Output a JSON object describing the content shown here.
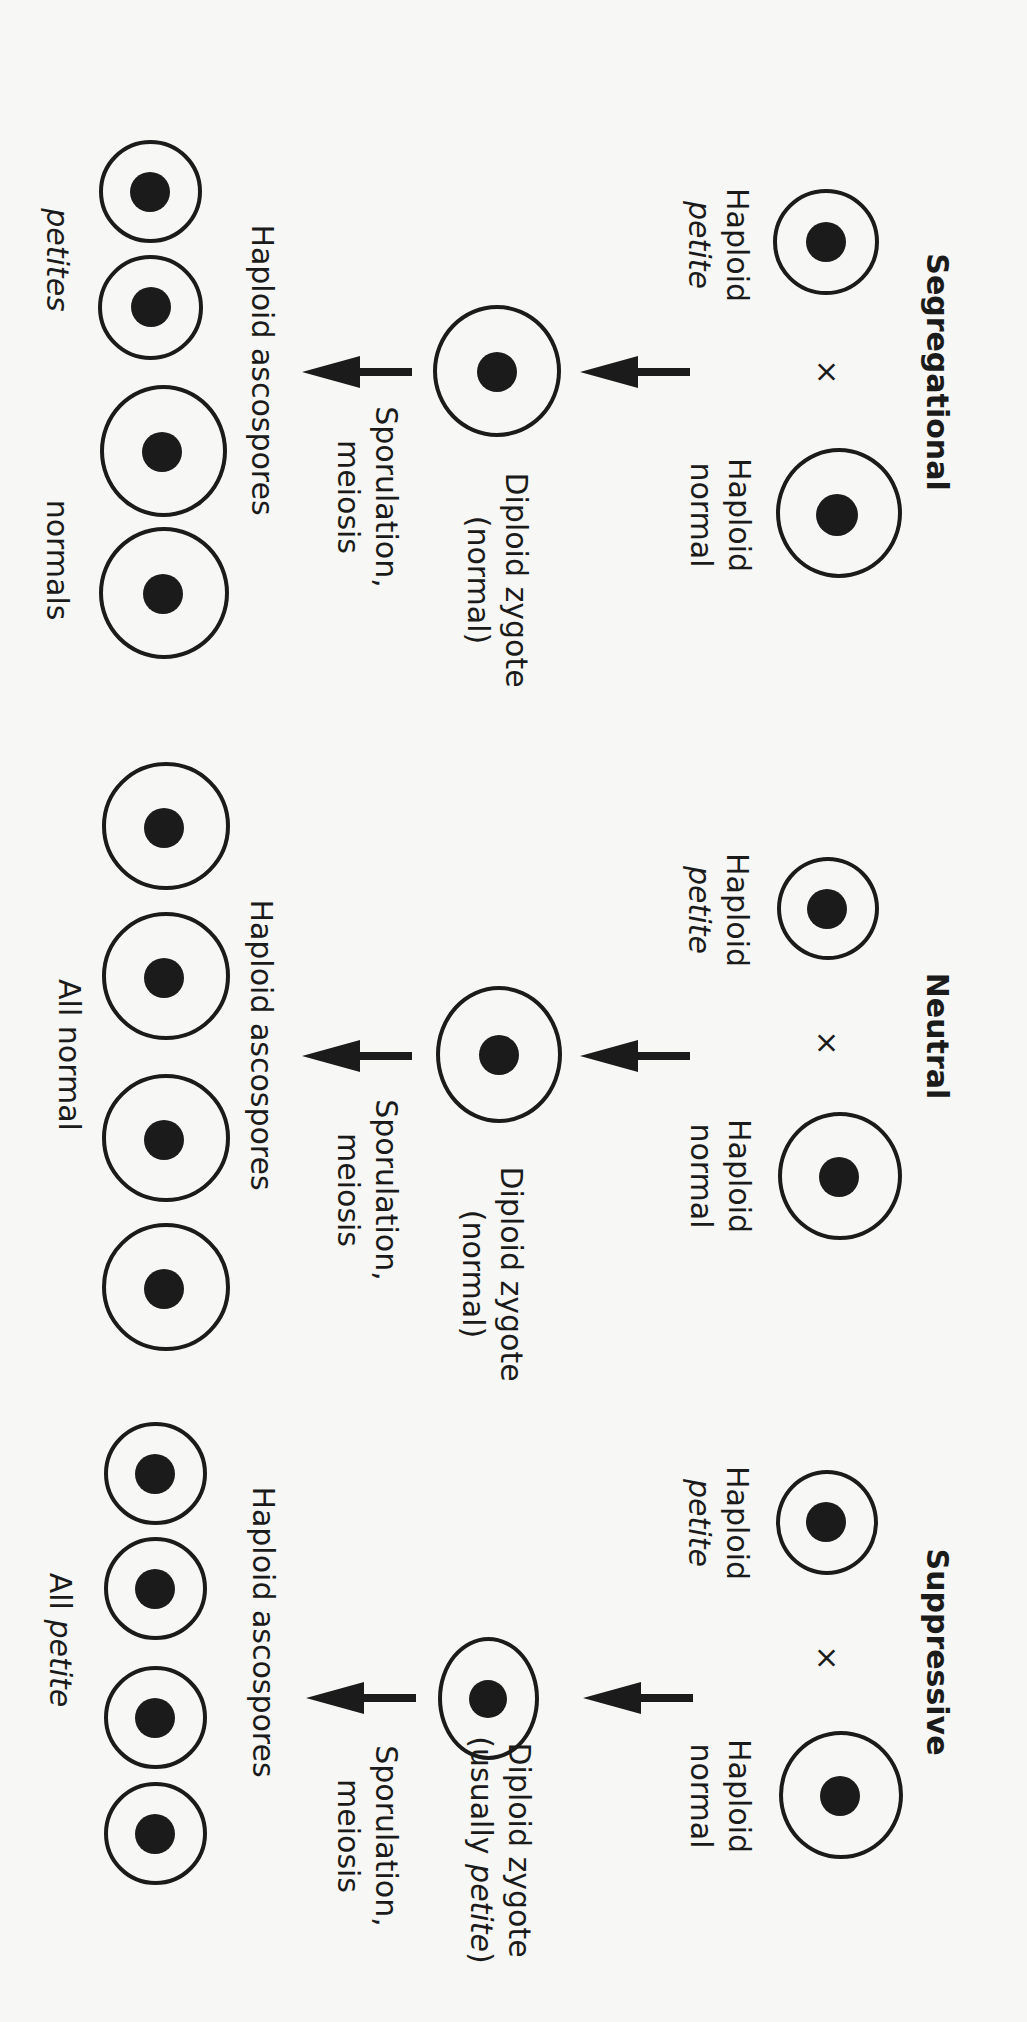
{
  "figure": {
    "orientation": "rotated 90 degrees clockwise",
    "colors": {
      "ink": "#1b1b1b",
      "background": "#f7f7f5"
    },
    "panels": [
      {
        "id": "segregational",
        "title": "Segregational",
        "cross_symbol": "×",
        "parent_petite": {
          "line1": "Haploid",
          "line2": "petite"
        },
        "parent_normal": {
          "line1": "Haploid",
          "line2": "normal"
        },
        "zygote": {
          "line1": "Diploid zygote",
          "line2": "(normal)"
        },
        "process": {
          "line1": "Sporulation,",
          "line2": "meiosis"
        },
        "spores_label": "Haploid ascospores",
        "outcome_left": "petites",
        "outcome_right": "normals",
        "spore_types": [
          "petite",
          "petite",
          "normal",
          "normal"
        ]
      },
      {
        "id": "neutral",
        "title": "Neutral",
        "cross_symbol": "×",
        "parent_petite": {
          "line1": "Haploid",
          "line2": "petite"
        },
        "parent_normal": {
          "line1": "Haploid",
          "line2": "normal"
        },
        "zygote": {
          "line1": "Diploid zygote",
          "line2": "(normal)"
        },
        "process": {
          "line1": "Sporulation,",
          "line2": "meiosis"
        },
        "spores_label": "Haploid ascospores",
        "outcome": "All normal",
        "spore_types": [
          "normal",
          "normal",
          "normal",
          "normal"
        ]
      },
      {
        "id": "suppressive",
        "title": "Suppressive",
        "cross_symbol": "×",
        "parent_petite": {
          "line1": "Haploid",
          "line2": "petite"
        },
        "parent_normal": {
          "line1": "Haploid",
          "line2": "normal"
        },
        "zygote": {
          "line1": "Diploid zygote",
          "line2_prefix": "(usually ",
          "line2_italic": "petite",
          "line2_suffix": ")"
        },
        "process": {
          "line1": "Sporulation,",
          "line2": "meiosis"
        },
        "spores_label": "Haploid ascospores",
        "outcome_prefix": "All ",
        "outcome_italic": "petite",
        "spore_types": [
          "petite",
          "petite",
          "petite",
          "petite"
        ]
      }
    ]
  }
}
